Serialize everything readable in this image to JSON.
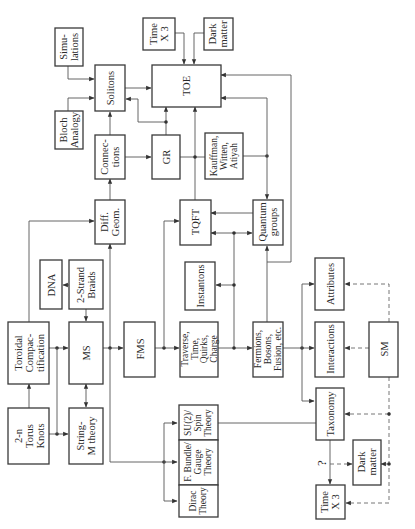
{
  "diagram": {
    "orientation": "rotated-90-ccw",
    "nodes": {
      "simulations": [
        "Simu-",
        "lations"
      ],
      "bloch": [
        "Bloch",
        "Analogy"
      ],
      "solitons": [
        "Solitons"
      ],
      "time_top": [
        "Time",
        "X 3"
      ],
      "dark_top": [
        "Dark",
        "matter"
      ],
      "toe": [
        "TOE"
      ],
      "connections": [
        "Connec-",
        "tions"
      ],
      "gr": [
        "GR"
      ],
      "kauffman": [
        "Kauffman,",
        "Witten,",
        "Atiyah"
      ],
      "diffgeom": [
        "Diff.",
        "Geom."
      ],
      "tqft": [
        "TQFT"
      ],
      "quantum": [
        "Quantum",
        "groups"
      ],
      "dna": [
        "DNA"
      ],
      "braids": [
        "2-Strand",
        "Braids"
      ],
      "instantons": [
        "Instantons"
      ],
      "attributes": [
        "Attributes"
      ],
      "toroidal": [
        "Toroidal",
        "Compac-",
        "tification"
      ],
      "ms": [
        "MS"
      ],
      "fms": [
        "FMS"
      ],
      "traverse": [
        "Traverse,",
        "Time,",
        "Quirks,",
        "Charge"
      ],
      "fermions": [
        "Fermions,",
        "Bosons,",
        "Fusion, etc."
      ],
      "interactions": [
        "Interactions"
      ],
      "sm": [
        "SM"
      ],
      "torusknots": [
        "2-n",
        "Torus",
        "Knots"
      ],
      "stringm": [
        "String-",
        "M theory"
      ],
      "su2": [
        "SU(2)/",
        "Spin",
        "Theory"
      ],
      "fbundle": [
        "F. Bundle/",
        "Gauge",
        "Theory"
      ],
      "dirac": [
        "Dirac",
        "Theory"
      ],
      "taxonomy": [
        "Taxonomy"
      ],
      "dark_bottom": [
        "Dark",
        "matter"
      ],
      "time_bottom": [
        "Time",
        "X 3"
      ]
    },
    "question_mark": "?"
  }
}
